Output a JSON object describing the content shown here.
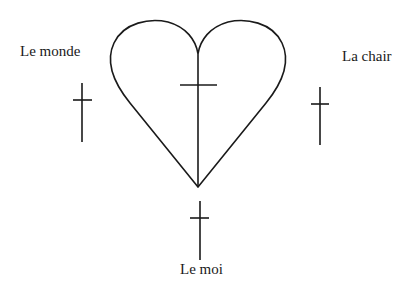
{
  "diagram": {
    "labels": {
      "world": "Le monde",
      "flesh": "La chair",
      "self": "Le moi"
    },
    "colors": {
      "stroke": "#1a1a1a",
      "background": "#ffffff"
    },
    "shapes": [
      "heart",
      "cross-in-heart",
      "cross-left",
      "cross-right",
      "cross-bottom"
    ]
  }
}
